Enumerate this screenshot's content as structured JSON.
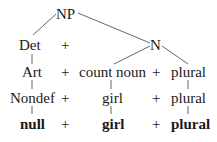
{
  "diagram": {
    "type": "syntax-tree",
    "root": "NP",
    "level1": {
      "det": "Det",
      "plus": "+",
      "n": "N"
    },
    "rows": [
      {
        "name": "row-art",
        "items": [
          "Art",
          "+",
          "count noun",
          "+",
          "plural"
        ],
        "bold": false
      },
      {
        "name": "row-nondef",
        "items": [
          "Nondef",
          "+",
          "girl",
          "+",
          "plural"
        ],
        "bold": false
      },
      {
        "name": "row-surface",
        "items": [
          "null",
          "+",
          "girl",
          "+",
          "plural"
        ],
        "bold": true
      }
    ]
  }
}
